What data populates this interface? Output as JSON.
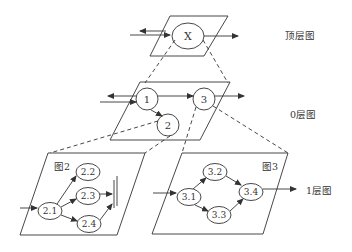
{
  "levels": {
    "top": {
      "label": "顶层图",
      "node": "X"
    },
    "zero": {
      "label": "0层图",
      "nodes": [
        "1",
        "2",
        "3"
      ]
    },
    "one": {
      "label": "1层图"
    }
  },
  "fig2": {
    "title": "图2",
    "nodes": [
      "2.1",
      "2.2",
      "2.3",
      "2.4"
    ]
  },
  "fig3": {
    "title": "图3",
    "nodes": [
      "3.1",
      "3.2",
      "3.3",
      "3.4"
    ]
  },
  "colors": {
    "line": "#333333",
    "background": "#ffffff"
  }
}
